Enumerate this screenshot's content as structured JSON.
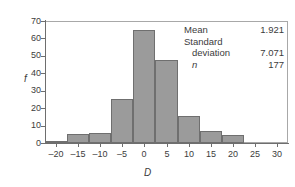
{
  "chart_data": {
    "type": "bar",
    "title": "",
    "xlabel": "D",
    "ylabel": "f",
    "xlim": [
      -22.5,
      32.5
    ],
    "ylim": [
      0,
      70
    ],
    "grid": false,
    "bin_width": 5,
    "bin_left_edges": [
      -22.5,
      -17.5,
      -12.5,
      -7.5,
      -2.5,
      2.5,
      7.5,
      12.5,
      17.5
    ],
    "categories": [
      "-22.5 to -17.5",
      "-17.5 to -12.5",
      "-12.5 to -7.5",
      "-7.5 to -2.5",
      "-2.5 to 2.5",
      "2.5 to 7.5",
      "7.5 to 12.5",
      "12.5 to 17.5",
      "17.5 to 22.5"
    ],
    "values": [
      1,
      5,
      6,
      25,
      65,
      47.5,
      15.5,
      7,
      4.5
    ],
    "xticks": [
      -20,
      -15,
      -10,
      -5,
      0,
      5,
      10,
      15,
      20,
      25,
      30
    ],
    "xticklabels": [
      "–20",
      "–15",
      "–10",
      "–5",
      "0",
      "5",
      "10",
      "15",
      "20",
      "25",
      "30"
    ],
    "yticks": [
      0,
      10,
      20,
      30,
      40,
      50,
      60,
      70
    ],
    "yticklabels": [
      "0",
      "10",
      "20",
      "30",
      "40",
      "50",
      "60",
      "70"
    ],
    "bar_color": "#9b9b9b",
    "bar_edge_color": "#6f6f6f",
    "axis_color": "#6e6e6e",
    "annotations": [
      {
        "label": "Mean",
        "value": "1.921"
      },
      {
        "label": "Standard",
        "value": ""
      },
      {
        "label": "deviation",
        "value": "7.071"
      },
      {
        "label": "n",
        "value": "177"
      }
    ]
  },
  "stats_panel": {
    "mean_label": "Mean",
    "mean_value": "1.921",
    "sd_label_line1": "Standard",
    "sd_label_line2": "deviation",
    "sd_value": "7.071",
    "n_label": "n",
    "n_value": "177"
  }
}
